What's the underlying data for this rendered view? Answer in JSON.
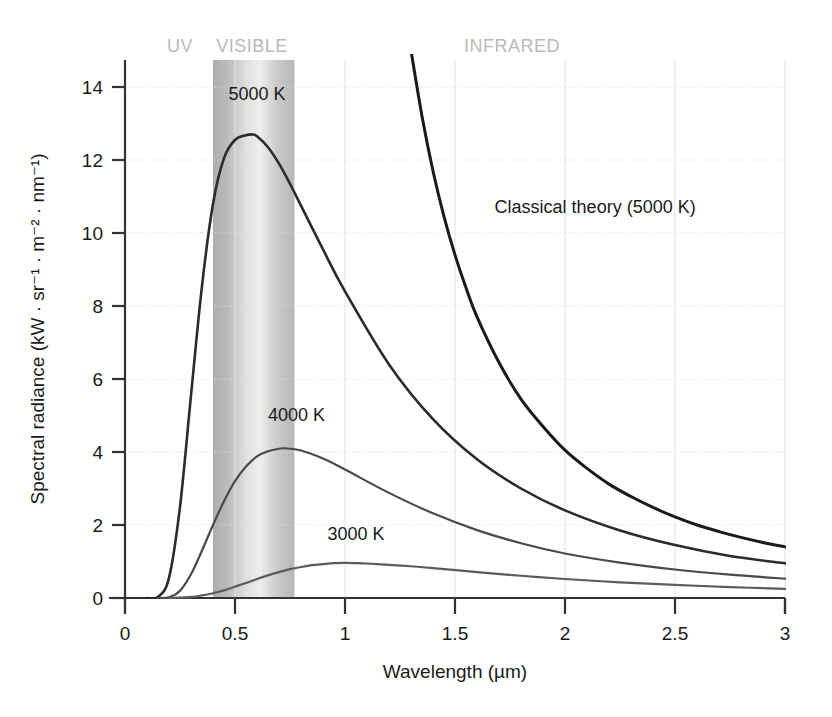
{
  "chart_data": {
    "type": "line",
    "title": "",
    "xlabel": "Wavelength (µm)",
    "ylabel": "Spectral radiance (kW · sr⁻¹ · m⁻² · nm⁻¹)",
    "xlim": [
      0,
      3
    ],
    "ylim": [
      0,
      15
    ],
    "xticks": [
      "0",
      "0.5",
      "1",
      "1.5",
      "2",
      "2.5",
      "3"
    ],
    "xtick_values": [
      0,
      0.5,
      1,
      1.5,
      2,
      2.5,
      3
    ],
    "yticks": [
      "0",
      "2",
      "4",
      "6",
      "8",
      "10",
      "12",
      "14"
    ],
    "ytick_values": [
      0,
      2,
      4,
      6,
      8,
      10,
      12,
      14
    ],
    "grid": "both-light-dotted",
    "legend": "inline-annotations",
    "series": [
      {
        "name": "5000 K",
        "label": "5000 K",
        "color": "#2b2b2b",
        "temperature_K": 5000,
        "peak_x": 0.58,
        "peak_y": 12.7,
        "points": [
          [
            0.1,
            0.0
          ],
          [
            0.15,
            0.03
          ],
          [
            0.2,
            0.55
          ],
          [
            0.25,
            2.5
          ],
          [
            0.3,
            5.55
          ],
          [
            0.35,
            8.55
          ],
          [
            0.4,
            10.8
          ],
          [
            0.45,
            12.05
          ],
          [
            0.5,
            12.55
          ],
          [
            0.55,
            12.68
          ],
          [
            0.58,
            12.7
          ],
          [
            0.6,
            12.65
          ],
          [
            0.65,
            12.35
          ],
          [
            0.7,
            11.9
          ],
          [
            0.75,
            11.35
          ],
          [
            0.8,
            10.75
          ],
          [
            0.9,
            9.55
          ],
          [
            1.0,
            8.4
          ],
          [
            1.2,
            6.4
          ],
          [
            1.4,
            4.9
          ],
          [
            1.6,
            3.8
          ],
          [
            1.8,
            3.0
          ],
          [
            2.0,
            2.4
          ],
          [
            2.25,
            1.85
          ],
          [
            2.5,
            1.45
          ],
          [
            2.75,
            1.15
          ],
          [
            3.0,
            0.95
          ]
        ]
      },
      {
        "name": "4000 K",
        "label": "4000 K",
        "color": "#4a4a4a",
        "temperature_K": 4000,
        "peak_x": 0.73,
        "peak_y": 4.1,
        "points": [
          [
            0.15,
            0.0
          ],
          [
            0.2,
            0.02
          ],
          [
            0.25,
            0.2
          ],
          [
            0.3,
            0.65
          ],
          [
            0.35,
            1.3
          ],
          [
            0.4,
            2.0
          ],
          [
            0.45,
            2.65
          ],
          [
            0.5,
            3.2
          ],
          [
            0.55,
            3.6
          ],
          [
            0.6,
            3.88
          ],
          [
            0.65,
            4.02
          ],
          [
            0.7,
            4.09
          ],
          [
            0.73,
            4.1
          ],
          [
            0.8,
            4.04
          ],
          [
            0.9,
            3.82
          ],
          [
            1.0,
            3.52
          ],
          [
            1.2,
            2.88
          ],
          [
            1.4,
            2.32
          ],
          [
            1.6,
            1.86
          ],
          [
            1.8,
            1.5
          ],
          [
            2.0,
            1.22
          ],
          [
            2.25,
            0.97
          ],
          [
            2.5,
            0.78
          ],
          [
            2.75,
            0.64
          ],
          [
            3.0,
            0.53
          ]
        ]
      },
      {
        "name": "3000 K",
        "label": "3000 K",
        "color": "#5c5c5c",
        "temperature_K": 3000,
        "peak_x": 1.0,
        "peak_y": 0.96,
        "points": [
          [
            0.2,
            0.0
          ],
          [
            0.3,
            0.03
          ],
          [
            0.35,
            0.07
          ],
          [
            0.4,
            0.13
          ],
          [
            0.45,
            0.21
          ],
          [
            0.5,
            0.31
          ],
          [
            0.55,
            0.41
          ],
          [
            0.6,
            0.52
          ],
          [
            0.65,
            0.62
          ],
          [
            0.7,
            0.71
          ],
          [
            0.75,
            0.79
          ],
          [
            0.8,
            0.85
          ],
          [
            0.85,
            0.9
          ],
          [
            0.9,
            0.93
          ],
          [
            0.95,
            0.955
          ],
          [
            1.0,
            0.96
          ],
          [
            1.05,
            0.955
          ],
          [
            1.1,
            0.945
          ],
          [
            1.2,
            0.91
          ],
          [
            1.3,
            0.87
          ],
          [
            1.4,
            0.82
          ],
          [
            1.6,
            0.71
          ],
          [
            1.8,
            0.61
          ],
          [
            2.0,
            0.52
          ],
          [
            2.25,
            0.43
          ],
          [
            2.5,
            0.36
          ],
          [
            2.75,
            0.3
          ],
          [
            3.0,
            0.25
          ]
        ]
      },
      {
        "name": "Classical theory (5000 K)",
        "label": "Classical theory (5000 K)",
        "color": "#1a1a1a",
        "temperature_K": 5000,
        "note": "Rayleigh-Jeans divergence at short wavelengths",
        "points": [
          [
            1.3,
            15.0
          ],
          [
            1.35,
            13.2
          ],
          [
            1.4,
            11.7
          ],
          [
            1.45,
            10.45
          ],
          [
            1.5,
            9.4
          ],
          [
            1.55,
            8.5
          ],
          [
            1.6,
            7.7
          ],
          [
            1.7,
            6.45
          ],
          [
            1.8,
            5.45
          ],
          [
            1.9,
            4.7
          ],
          [
            2.0,
            4.05
          ],
          [
            2.1,
            3.55
          ],
          [
            2.2,
            3.12
          ],
          [
            2.3,
            2.78
          ],
          [
            2.4,
            2.48
          ],
          [
            2.5,
            2.22
          ],
          [
            2.6,
            2.0
          ],
          [
            2.7,
            1.82
          ],
          [
            2.8,
            1.66
          ],
          [
            2.9,
            1.52
          ],
          [
            3.0,
            1.4
          ]
        ]
      }
    ],
    "bands": [
      {
        "name": "UV",
        "label": "UV",
        "x_start": 0.0,
        "x_end": 0.4,
        "shaded": false
      },
      {
        "name": "VISIBLE",
        "label": "VISIBLE",
        "x_start": 0.4,
        "x_end": 0.77,
        "shaded": true
      },
      {
        "name": "INFRARED",
        "label": "INFRARED",
        "x_start": 0.77,
        "x_end": 3.0,
        "shaded": false
      }
    ],
    "annotations": [
      {
        "text": "5000 K",
        "x": 0.6,
        "y": 13.65
      },
      {
        "text": "4000 K",
        "x": 0.78,
        "y": 4.85
      },
      {
        "text": "3000 K",
        "x": 1.05,
        "y": 1.6
      },
      {
        "text": "Classical theory (5000 K)",
        "x": 1.68,
        "y": 10.55
      }
    ],
    "colors": {
      "background": "#ffffff",
      "axis": "#333333",
      "grid": "#dedede",
      "band_label": "#b9b9b9",
      "band_shade_edge": "#b0b0b0",
      "band_shade_center": "#e8e8e8",
      "text": "#1a1a1a"
    }
  }
}
